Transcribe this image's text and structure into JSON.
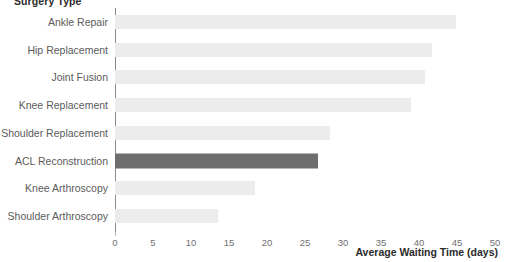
{
  "chart_data": {
    "type": "bar",
    "orientation": "horizontal",
    "title": "",
    "ylabel": "Surgery Type",
    "xlabel": "Average Waiting Time (days)",
    "categories": [
      "Ankle Repair",
      "Hip Replacement",
      "Joint Fusion",
      "Knee Replacement",
      "Shoulder Replacement",
      "ACL Reconstruction",
      "Knee Arthroscopy",
      "Shoulder Arthroscopy"
    ],
    "values": [
      44.9,
      41.7,
      40.8,
      39.0,
      28.3,
      26.7,
      18.4,
      13.6
    ],
    "xlim": [
      0,
      50
    ],
    "xticks": [
      "0",
      "5",
      "10",
      "15",
      "20",
      "25",
      "30",
      "35",
      "40",
      "45",
      "50"
    ],
    "xtick_values": [
      0,
      5,
      10,
      15,
      20,
      25,
      30,
      35,
      40,
      45,
      50
    ],
    "grid": false,
    "legend": "none",
    "highlight_category": "ACL Reconstruction",
    "colors": {
      "bar": "#ececec",
      "bar_highlight": "#6e6e6e",
      "axis": "#8a8a8a",
      "tick_label": "#6f6f6f",
      "category_label": "#5b5b5b",
      "axis_title": "#2b2b2b",
      "background": "#ffffff"
    }
  }
}
